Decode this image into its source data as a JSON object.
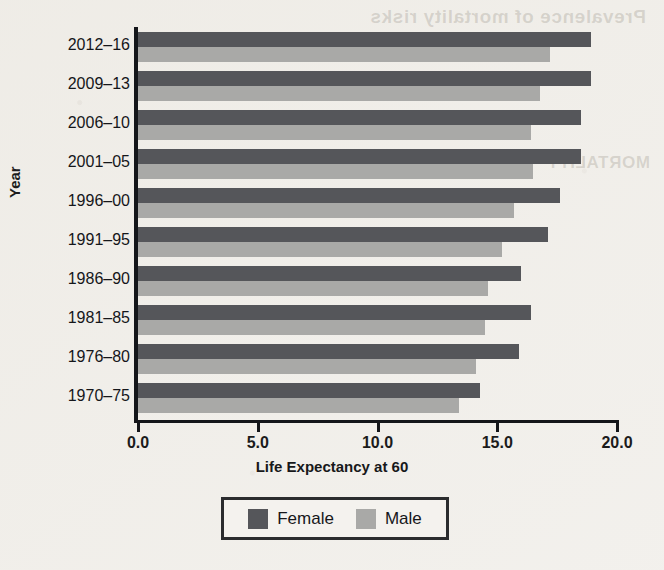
{
  "page": {
    "background_color": "#f2f0ec",
    "bleed_through_top": "Prevalence of mortality risks",
    "bleed_through_side": "MORTALITY"
  },
  "chart_data": {
    "type": "bar",
    "orientation": "horizontal",
    "title": "",
    "xlabel": "Life Expectancy at 60",
    "ylabel": "Year",
    "xlim": [
      0.0,
      20.0
    ],
    "xticks": [
      "0.0",
      "5.0",
      "10.0",
      "15.0",
      "20.0"
    ],
    "xtick_values": [
      0.0,
      5.0,
      10.0,
      15.0,
      20.0
    ],
    "grid": false,
    "legend_position": "bottom-center",
    "categories": [
      "2012–16",
      "2009–13",
      "2006–10",
      "2001–05",
      "1996–00",
      "1991–95",
      "1986–90",
      "1981–85",
      "1976–80",
      "1970–75"
    ],
    "series": [
      {
        "name": "Female",
        "color": "#55565a",
        "values": [
          18.9,
          18.9,
          18.5,
          18.5,
          17.6,
          17.1,
          16.0,
          16.4,
          15.9,
          14.3
        ]
      },
      {
        "name": "Male",
        "color": "#a9a9a7",
        "values": [
          17.2,
          16.8,
          16.4,
          16.5,
          15.7,
          15.2,
          14.6,
          14.5,
          14.1,
          13.4
        ]
      }
    ]
  },
  "legend": {
    "entries": [
      {
        "label": "Female",
        "color": "#55565a"
      },
      {
        "label": "Male",
        "color": "#a9a9a7"
      }
    ]
  }
}
